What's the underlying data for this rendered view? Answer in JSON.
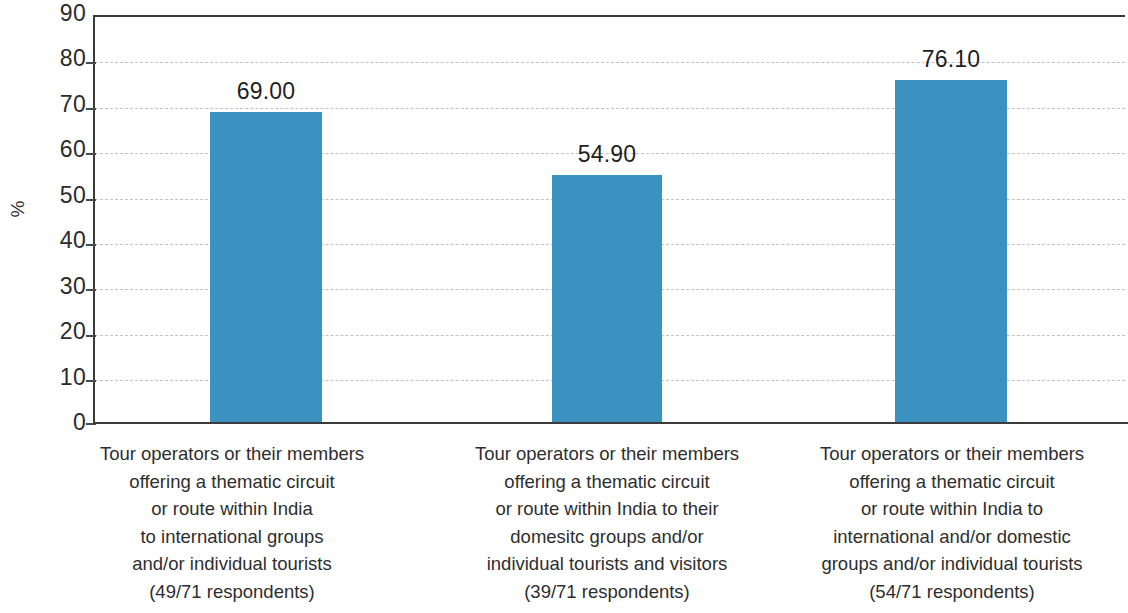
{
  "chart_data": {
    "type": "bar",
    "title": "",
    "subtitle": "",
    "xlabel": "",
    "ylabel": "%",
    "ylim": [
      0,
      90
    ],
    "y_ticks": [
      0,
      10,
      20,
      30,
      40,
      50,
      60,
      70,
      80,
      90
    ],
    "grid": true,
    "legend": "none",
    "bar_color": "#3a92c0",
    "value_label_format": "2dp",
    "categories": [
      "Tour operators or their members offering a thematic circuit or route within India to international groups and/or individual tourists (49/71 respondents)",
      "Tour operators or their members offering a thematic circuit or route within India to their domesitc groups and/or individual tourists and visitors (39/71 respondents)",
      "Tour operators or their members offering a thematic circuit or route within India to international and/or domestic groups and/or individual tourists (54/71 respondents)"
    ],
    "category_lines": [
      [
        "Tour operators or their members",
        "offering a thematic circuit",
        "or route within India",
        "to international groups",
        "and/or individual tourists",
        "(49/71 respondents)"
      ],
      [
        "Tour operators or their members",
        "offering a thematic circuit",
        "or route within India to their",
        "domesitc groups and/or",
        "individual tourists and visitors",
        "(39/71 respondents)"
      ],
      [
        "Tour operators or their members",
        "offering a thematic circuit",
        "or route within India to",
        "international and/or domestic",
        "groups and/or individual tourists",
        "(54/71 respondents)"
      ]
    ],
    "values": [
      69.0,
      54.9,
      76.1
    ],
    "value_labels": [
      "69.00",
      "54.90",
      "76.10"
    ],
    "respondents": [
      "49/71",
      "39/71",
      "54/71"
    ]
  },
  "axis": {
    "y_tick_labels": [
      "90",
      "80",
      "70",
      "60",
      "50",
      "40",
      "30",
      "20",
      "10",
      "0"
    ],
    "y_title": "%"
  }
}
